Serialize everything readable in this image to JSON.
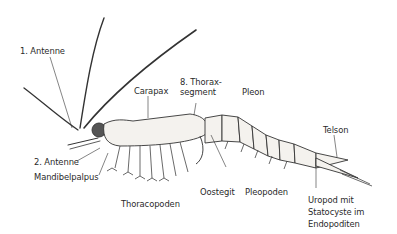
{
  "figure": {
    "labels": {
      "antenne1": "1. Antenne",
      "antenne2": "2. Antenne",
      "mandibelpalpus": "Mandibelpalpus",
      "carapax": "Carapax",
      "thoraxsegment_line1": "8. Thorax-",
      "thoraxsegment_line2": "segment",
      "pleon": "Pleon",
      "telson": "Telson",
      "oostegit": "Oostegit",
      "pleopoden": "Pleopoden",
      "thoracopoden": "Thoracopoden",
      "uropod_line1": "Uropod mit",
      "uropod_line2": "Statocyste im",
      "uropod_line3": "Endopoditen"
    },
    "colors": {
      "ink": "#2a2a2a",
      "body_fill": "#f4f2ee",
      "background": "#ffffff"
    }
  }
}
